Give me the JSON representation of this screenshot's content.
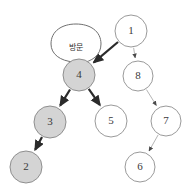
{
  "diagram": {
    "colors": {
      "visited_fill": "#d4d4d4",
      "unvisited_fill": "#ffffff",
      "node_stroke": "#9a9a9a",
      "visited_node_stroke": "#8f8f8f",
      "active_edge": "#2b2b2b",
      "inactive_edge": "#b5b5b5",
      "text": "#3a3a3a",
      "background": "#ffffff"
    },
    "callout": {
      "text": "방문",
      "target_node": "4"
    },
    "nodes": [
      {
        "id": "1",
        "label": "1",
        "cx": 131,
        "cy": 31,
        "r": 16,
        "visited": false
      },
      {
        "id": "4",
        "label": "4",
        "cx": 79,
        "cy": 75,
        "r": 16,
        "visited": true
      },
      {
        "id": "8",
        "label": "8",
        "cx": 138,
        "cy": 76,
        "r": 15,
        "visited": false
      },
      {
        "id": "3",
        "label": "3",
        "cx": 50,
        "cy": 122,
        "r": 16,
        "visited": true
      },
      {
        "id": "5",
        "label": "5",
        "cx": 111,
        "cy": 121,
        "r": 16,
        "visited": false
      },
      {
        "id": "7",
        "label": "7",
        "cx": 166,
        "cy": 121,
        "r": 15,
        "visited": false
      },
      {
        "id": "2",
        "label": "2",
        "cx": 26,
        "cy": 167,
        "r": 16,
        "visited": true
      },
      {
        "id": "6",
        "label": "6",
        "cx": 140,
        "cy": 167,
        "r": 15,
        "visited": false
      }
    ],
    "edges": [
      {
        "from": "1",
        "to": "4",
        "active": true
      },
      {
        "from": "4",
        "to": "3",
        "active": true
      },
      {
        "from": "4",
        "to": "5",
        "active": true
      },
      {
        "from": "3",
        "to": "2",
        "active": true
      },
      {
        "from": "1",
        "to": "8",
        "active": false
      },
      {
        "from": "8",
        "to": "7",
        "active": false
      },
      {
        "from": "7",
        "to": "6",
        "active": false
      }
    ]
  }
}
